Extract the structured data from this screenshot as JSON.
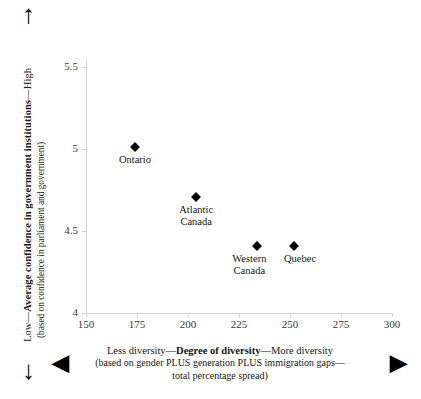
{
  "chart_data": {
    "type": "scatter",
    "title": "",
    "xlabel": "Degree of diversity",
    "ylabel": "Average confidence in government institutions",
    "xlim": [
      150,
      300
    ],
    "ylim": [
      4,
      5.5
    ],
    "grid": false,
    "legend": "none",
    "x_ticks": [
      "150",
      "175",
      "200",
      "225",
      "250",
      "275",
      "300"
    ],
    "y_ticks": [
      "5.5",
      "5",
      "4.5",
      "4"
    ],
    "points": [
      {
        "label": "Ontario",
        "label_lines": [
          "Ontario"
        ],
        "x": 174,
        "y": 5.01
      },
      {
        "label": "Atlantic Canada",
        "label_lines": [
          "Atlantic",
          "Canada"
        ],
        "x": 204,
        "y": 4.71
      },
      {
        "label": "Western Canada",
        "label_lines": [
          "Western",
          "Canada"
        ],
        "x": 234,
        "y": 4.41
      },
      {
        "label": "Quebec",
        "label_lines": [
          "Quebec"
        ],
        "x": 252,
        "y": 4.41
      }
    ]
  },
  "y_axis": {
    "low_text": "Low",
    "high_text": "High",
    "title": "Average confidence in government institutions",
    "full_title": "Low—Average confidence in government institutions—High",
    "subtitle": "(based on confidence in parliament and government)",
    "ticks": [
      {
        "value": "5.5",
        "top": 67
      },
      {
        "value": "5",
        "top": 149
      },
      {
        "value": "4.5",
        "top": 231
      },
      {
        "value": "4",
        "top": 313
      }
    ]
  },
  "x_axis": {
    "less_text": "Less diversity—",
    "title": "Degree of diversity",
    "more_text": "—More diversity",
    "subtitle_line1": "(based on gender PLUS generation PLUS immigration gaps—",
    "subtitle_line2": "total percentage spread)",
    "ticks": [
      {
        "value": "150",
        "left": 86
      },
      {
        "value": "175",
        "left": 137
      },
      {
        "value": "200",
        "left": 188
      },
      {
        "value": "225",
        "left": 239
      },
      {
        "value": "250",
        "left": 290
      },
      {
        "value": "275",
        "left": 341
      },
      {
        "value": "300",
        "left": 392
      }
    ]
  },
  "arrows": {
    "up": "↑",
    "down": "↓",
    "left": "◀",
    "right": "▶"
  },
  "colors": {
    "marker": "#000000",
    "axis": "#d2d2d2",
    "text": "#151515",
    "background": "#ffffff"
  }
}
